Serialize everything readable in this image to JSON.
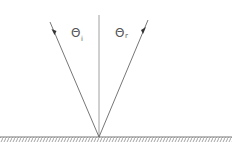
{
  "diagram": {
    "labels": {
      "theta_i": "Θ",
      "theta_i_sub": "i",
      "theta_r": "Θ",
      "theta_r_sub": "r"
    },
    "colors": {
      "line": "#666666",
      "label": "#555555",
      "hatch": "#888888"
    },
    "elements": {
      "incident_ray": {
        "from": [
          50,
          22
        ],
        "to": [
          99,
          137
        ]
      },
      "reflected_ray": {
        "from": [
          99,
          137
        ],
        "to": [
          148,
          20
        ]
      },
      "normal": {
        "from": [
          99,
          15
        ],
        "to": [
          99,
          137
        ]
      },
      "surface": {
        "from": [
          0,
          137
        ],
        "to": [
          232,
          137
        ]
      }
    }
  }
}
